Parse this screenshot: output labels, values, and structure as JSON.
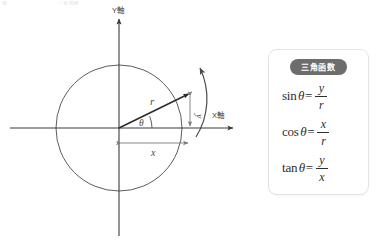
{
  "page": {
    "width": 378,
    "height": 240,
    "background": "#ffffff",
    "top_artifact_left": "図",
    "top_artifact_right": "三角関数"
  },
  "diagram": {
    "name": "unit-circle-trigonometry-diagram",
    "y_axis_label": "Y軸",
    "x_axis_label": "X軸",
    "radius_label": "r",
    "angle_label": "θ",
    "x_component_label": "x",
    "y_component_label": "y",
    "center": {
      "x": 119,
      "y": 128
    },
    "radius_px": 63,
    "terminal_point": {
      "x": 190,
      "y": 93
    },
    "colors": {
      "circle_stroke": "#4a4a4a",
      "axis_stroke": "#3a3a3a",
      "vector_stroke": "#2a2a2a",
      "dimension_stroke": "#7a7a7a",
      "rotation_arrow_stroke": "#4a4a4a"
    }
  },
  "card": {
    "name": "trigonometric-functions-card",
    "badge": "三角函数",
    "badge_color": "#6d6d6d",
    "formulas": [
      {
        "name": "sine-formula",
        "fn": "sin",
        "variable": "θ",
        "equals": "=",
        "numerator": "y",
        "denominator": "r"
      },
      {
        "name": "cosine-formula",
        "fn": "cos",
        "variable": "θ",
        "equals": "=",
        "numerator": "x",
        "denominator": "r"
      },
      {
        "name": "tangent-formula",
        "fn": "tan",
        "variable": "θ",
        "equals": "=",
        "numerator": "y",
        "denominator": "x"
      }
    ]
  }
}
